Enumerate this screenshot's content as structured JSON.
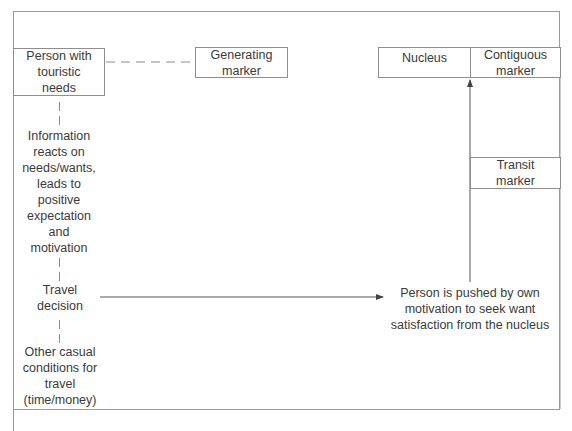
{
  "diagram": {
    "left_column": {
      "person_box": "Person with touristic needs",
      "information": "Information reacts on needs/wants, leads to positive expectation and motivation",
      "travel_decision": "Travel decision",
      "other_conditions": "Other casual conditions for travel (time/money)"
    },
    "generating_marker": "Generating marker",
    "nucleus": "Nucleus",
    "contiguous_marker": "Contiguous marker",
    "transit_marker": "Transit marker",
    "push_text": "Person is pushed by own motivation to seek want satisfaction from the nucleus",
    "connectors": [
      {
        "from": "Person with touristic needs",
        "to": "Generating marker",
        "style": "dashed"
      },
      {
        "from": "Person with touristic needs",
        "to": "Information reacts on needs/wants...",
        "style": "dashed"
      },
      {
        "from": "Information reacts on needs/wants...",
        "to": "Travel decision",
        "style": "dashed"
      },
      {
        "from": "Travel decision",
        "to": "Other casual conditions for travel",
        "style": "dashed"
      },
      {
        "from": "Travel decision",
        "to": "Person is pushed by own motivation...",
        "style": "arrow"
      },
      {
        "from": "Person is pushed by own motivation...",
        "to": "Nucleus",
        "style": "arrow"
      }
    ]
  }
}
